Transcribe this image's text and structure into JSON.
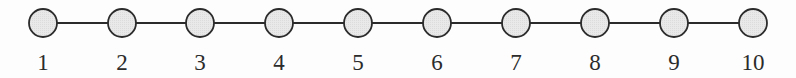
{
  "figure": {
    "kind": "path-graph-diagram",
    "background_color": "#fdfdfd",
    "width": 796,
    "height": 78
  },
  "style": {
    "node_fill": "#e6e6e6",
    "node_stroke": "#2b2b2b",
    "node_stroke_width": 1.8,
    "node_radius": 14,
    "edge_color": "#2b2b2b",
    "edge_width": 2,
    "label_color": "#2b2b2b",
    "label_font_size": 23,
    "node_center_y": 23,
    "label_baseline_y": 70
  },
  "chart_data": {
    "type": "diagram",
    "subtype": "path-graph",
    "title": "",
    "node_count": 10,
    "edge_count": 9,
    "layout": "horizontal-linear",
    "nodes": [
      {
        "id": 1,
        "label": "1",
        "cx": 43,
        "cy": 23
      },
      {
        "id": 2,
        "label": "2",
        "cx": 122,
        "cy": 23
      },
      {
        "id": 3,
        "label": "3",
        "cx": 200,
        "cy": 23
      },
      {
        "id": 4,
        "label": "4",
        "cx": 279,
        "cy": 23
      },
      {
        "id": 5,
        "label": "5",
        "cx": 358,
        "cy": 23
      },
      {
        "id": 6,
        "label": "6",
        "cx": 437,
        "cy": 23
      },
      {
        "id": 7,
        "label": "7",
        "cx": 516,
        "cy": 23
      },
      {
        "id": 8,
        "label": "8",
        "cx": 595,
        "cy": 23
      },
      {
        "id": 9,
        "label": "9",
        "cx": 674,
        "cy": 23
      },
      {
        "id": 10,
        "label": "10",
        "cx": 753,
        "cy": 23
      }
    ],
    "edges": [
      {
        "source": 1,
        "target": 2
      },
      {
        "source": 2,
        "target": 3
      },
      {
        "source": 3,
        "target": 4
      },
      {
        "source": 4,
        "target": 5
      },
      {
        "source": 5,
        "target": 6
      },
      {
        "source": 6,
        "target": 7
      },
      {
        "source": 7,
        "target": 8
      },
      {
        "source": 8,
        "target": 9
      },
      {
        "source": 9,
        "target": 10
      }
    ]
  }
}
